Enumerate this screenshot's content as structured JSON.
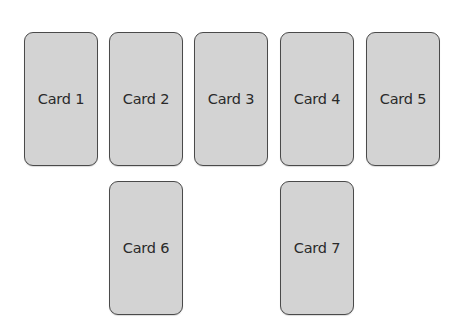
{
  "cards": [
    {
      "label": "Card 1",
      "x": 24,
      "y": 32
    },
    {
      "label": "Card 2",
      "x": 109,
      "y": 32
    },
    {
      "label": "Card 3",
      "x": 194,
      "y": 32
    },
    {
      "label": "Card 4",
      "x": 280,
      "y": 32
    },
    {
      "label": "Card 5",
      "x": 366,
      "y": 32
    },
    {
      "label": "Card 6",
      "x": 109,
      "y": 181
    },
    {
      "label": "Card 7",
      "x": 280,
      "y": 181
    }
  ],
  "colors": {
    "card_fill": "#d3d3d3",
    "card_border": "#4a4a4a",
    "text": "#2a2a2a"
  }
}
